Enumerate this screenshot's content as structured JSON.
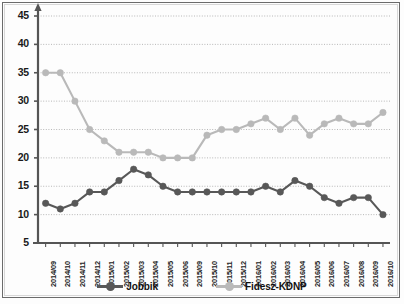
{
  "chart_data": {
    "type": "line",
    "title": "",
    "xlabel": "",
    "ylabel": "",
    "ylim": [
      5,
      45
    ],
    "ytick_step": 5,
    "grid": true,
    "legend_position": "bottom",
    "categories": [
      "2014/09",
      "2014/10",
      "2014/11",
      "2014/12",
      "2015/01",
      "2015/02",
      "2015/03",
      "2015/04",
      "2015/05",
      "2015/06",
      "2015/09",
      "2015/10",
      "2015/11",
      "2015/12",
      "2016/01",
      "2016/02",
      "2016/03",
      "2016/04",
      "2016/05",
      "2016/06",
      "2016/07",
      "2016/08",
      "2016/09",
      "2016/10"
    ],
    "yticks": [
      5,
      10,
      15,
      20,
      25,
      30,
      35,
      40,
      45
    ],
    "series": [
      {
        "name": "Jobbik",
        "color": "#585858",
        "values": [
          12,
          11,
          12,
          14,
          14,
          16,
          18,
          17,
          15,
          14,
          14,
          14,
          14,
          14,
          14,
          15,
          14,
          16,
          15,
          13,
          12,
          13,
          13,
          10
        ]
      },
      {
        "name": "Fidesz-KDNP",
        "color": "#b9b9b9",
        "values": [
          35,
          35,
          30,
          25,
          23,
          21,
          21,
          21,
          20,
          20,
          20,
          24,
          25,
          25,
          26,
          27,
          25,
          27,
          24,
          26,
          27,
          26,
          26,
          28
        ]
      }
    ]
  },
  "legend": {
    "items": [
      {
        "label": "Jobbik"
      },
      {
        "label": "Fidesz-KDNP"
      }
    ]
  }
}
